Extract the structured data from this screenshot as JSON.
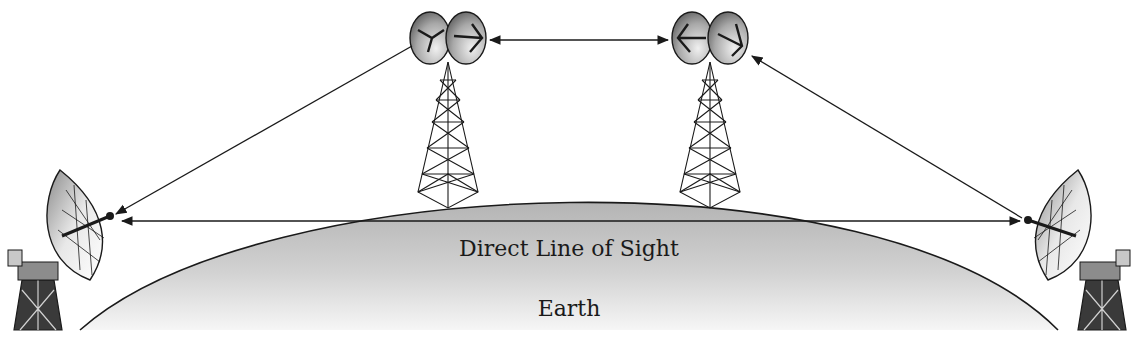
{
  "diagram": {
    "type": "microwave relay / line-of-sight illustration",
    "labels": {
      "line_of_sight": "Direct Line of Sight",
      "earth": "Earth"
    },
    "elements": {
      "left_ground_dish": "Parabolic ground antenna (left)",
      "right_ground_dish": "Parabolic ground antenna (right)",
      "relay_tower_1": "Lattice relay tower with twin dishes (left)",
      "relay_tower_2": "Lattice relay tower with twin dishes (right)",
      "earth_curve": "Earth curvature (shaded arc)"
    },
    "links": [
      {
        "from": "relay_tower_1",
        "to": "left_ground_dish",
        "style": "single arrow"
      },
      {
        "from": "relay_tower_1",
        "to": "relay_tower_2",
        "style": "double arrow"
      },
      {
        "from": "right_ground_dish",
        "to": "relay_tower_2",
        "style": "single arrow"
      },
      {
        "from": "left_ground_dish",
        "to": "right_ground_dish",
        "style": "double arrow",
        "note": "blocked by Earth curvature"
      }
    ],
    "colors": {
      "line": "#1a1a1a",
      "earth_fill_top": "#b4b4b4",
      "earth_fill_bottom": "#f4f4f4",
      "dish_dark": "#6a6a6a",
      "dish_light": "#e6e6e6"
    }
  }
}
